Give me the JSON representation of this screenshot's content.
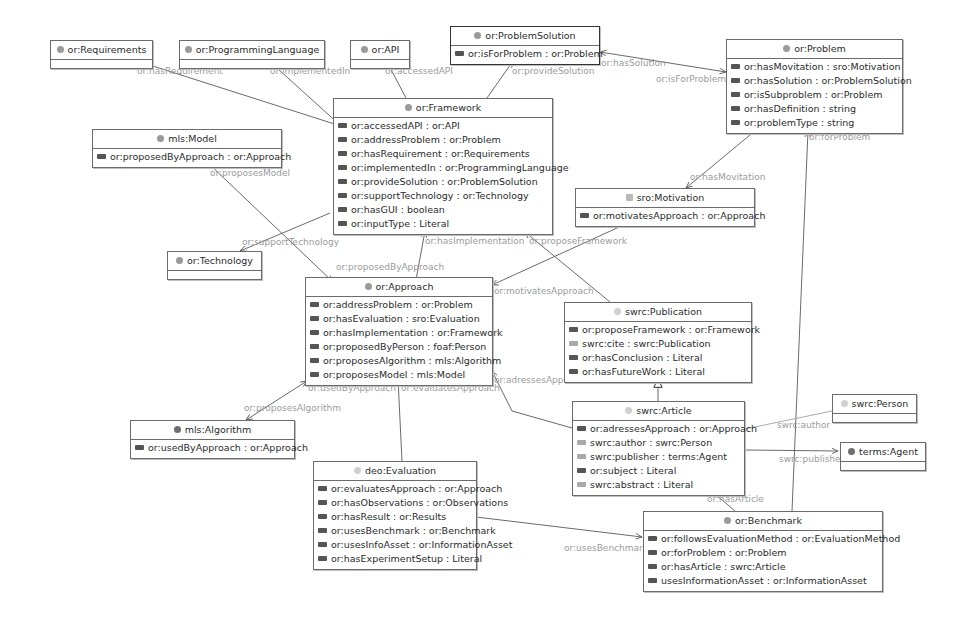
{
  "diagram": {
    "type": "ontology-class-diagram",
    "nodes": {
      "requirements": {
        "title": "or:Requirements",
        "attributes": []
      },
      "programming_language": {
        "title": "or:ProgrammingLanguage",
        "attributes": []
      },
      "api": {
        "title": "or:API",
        "attributes": []
      },
      "problem_solution": {
        "title": "or:ProblemSolution",
        "attributes": [
          "or:isForProblem : or:Problem"
        ]
      },
      "problem": {
        "title": "or:Problem",
        "attributes": [
          "or:hasMovitation : sro:Motivation",
          "or:hasSolution : or:ProblemSolution",
          "or:isSubproblem : or:Problem",
          "or:hasDefinition : string",
          "or:problemType : string"
        ]
      },
      "model": {
        "title": "mls:Model",
        "attributes": [
          "or:proposedByApproach : or:Approach"
        ]
      },
      "framework": {
        "title": "or:Framework",
        "attributes": [
          "or:accessedAPI : or:API",
          "or:addressProblem : or:Problem",
          "or:hasRequirement : or:Requirements",
          "or:implementedIn : or:ProgrammingLanguage",
          "or:provideSolution : or:ProblemSolution",
          "or:supportTechnology : or:Technology",
          "or:hasGUI : boolean",
          "or:inputType : Literal"
        ]
      },
      "motivation": {
        "title": "sro:Motivation",
        "attributes": [
          "or:motivatesApproach : or:Approach"
        ]
      },
      "technology": {
        "title": "or:Technology",
        "attributes": []
      },
      "approach": {
        "title": "or:Approach",
        "attributes": [
          "or:addressProblem : or:Problem",
          "or:hasEvaluation : sro:Evaluation",
          "or:hasImplementation : or:Framework",
          "or:proposedByPerson : foaf:Person",
          "or:proposesAlgorithm : mls:Algorithm",
          "or:proposesModel : mls:Model"
        ]
      },
      "publication": {
        "title": "swrc:Publication",
        "attributes": [
          "or:proposeFramework : or:Framework",
          "swrc:cite : swrc:Publication",
          "or:hasConclusion : Literal",
          "or:hasFutureWork : Literal"
        ]
      },
      "algorithm": {
        "title": "mls:Algorithm",
        "attributes": [
          "or:usedByApproach : or:Approach"
        ]
      },
      "article": {
        "title": "swrc:Article",
        "attributes": [
          "or:adressesApproach : or:Approach",
          "swrc:author : swrc:Person",
          "swrc:publisher : terms:Agent",
          "or:subject : Literal",
          "swrc:abstract : Literal"
        ]
      },
      "person": {
        "title": "swrc:Person",
        "attributes": []
      },
      "agent": {
        "title": "terms:Agent",
        "attributes": []
      },
      "evaluation": {
        "title": "deo:Evaluation",
        "attributes": [
          "or:evaluatesApproach : or:Approach",
          "or:hasObservations : or:Observations",
          "or:hasResult : or:Results",
          "or:usesBenchmark : or:Benchmark",
          "or:usesInfoAsset : or:InformationAsset",
          "or:hasExperimentSetup : Literal"
        ]
      },
      "benchmark": {
        "title": "or:Benchmark",
        "attributes": [
          "or:followsEvaluationMethod : or:EvaluationMethod",
          "or:forProblem : or:Problem",
          "or:hasArticle : swrc:Article",
          "usesInformationAsset : or:InformationAsset"
        ]
      }
    },
    "edge_labels": {
      "has_requirement": "or:hasRequirement",
      "implemented_in": "or:implementedIn",
      "accessed_api": "or:accessedAPI",
      "provide_solution": "or:provideSolution",
      "has_solution": "or:hasSolution",
      "is_for_problem": "or:isForProblem",
      "proposes_model": "or:proposesModel",
      "support_technology": "or:supportTechnology",
      "has_movitation": "or:hasMovitation",
      "for_problem": "or:forProblem",
      "proposed_by_approach": "or:proposedByApproach",
      "has_implementation": "or:hasImplementation",
      "propose_framework": "or:proposeFramework",
      "motivates_approach": "or:motivatesApproach",
      "proposes_algorithm": "or:proposesAlgorithm",
      "used_by_approach": "or:usedByApproach",
      "evaluates_approach": "or:evaluatesApproach",
      "adresses_approach": "or:adressesApproach",
      "swrc_author": "swrc:author",
      "swrc_publisher": "swrc:publisher",
      "has_article": "or:hasArticle",
      "uses_benchmark": "or:usesBenchmark"
    }
  }
}
